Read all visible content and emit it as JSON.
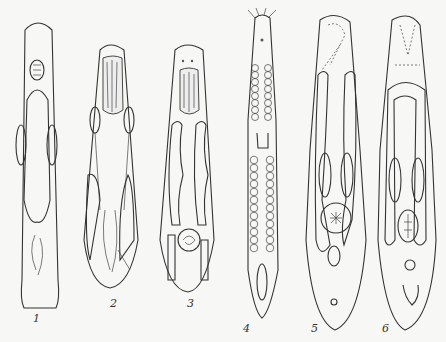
{
  "figure": {
    "background_color": "#f7f7f5",
    "ink_color": "#333333",
    "specimens": [
      {
        "label": "1",
        "x": 33,
        "y": 312
      },
      {
        "label": "2",
        "x": 110,
        "y": 297
      },
      {
        "label": "3",
        "x": 187,
        "y": 297
      },
      {
        "label": "4",
        "x": 243,
        "y": 322
      },
      {
        "label": "5",
        "x": 311,
        "y": 322
      },
      {
        "label": "6",
        "x": 382,
        "y": 322
      }
    ]
  }
}
